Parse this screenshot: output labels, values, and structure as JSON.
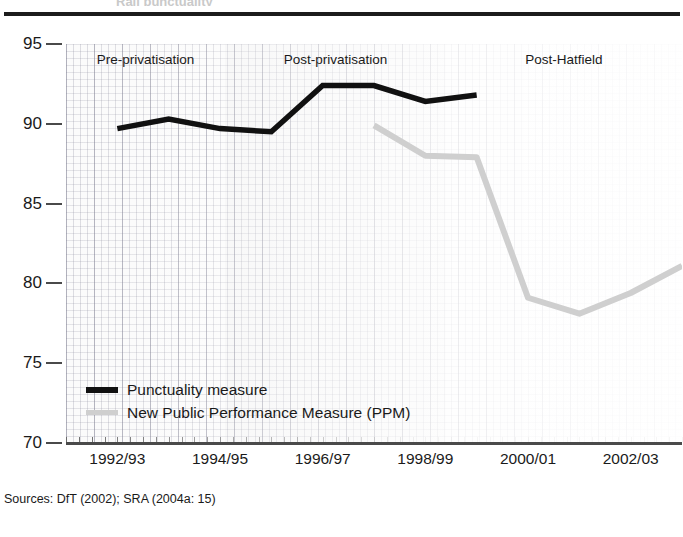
{
  "figure": {
    "clipped_title": "Rail punctuality",
    "source_note": "Sources: DfT (2002); SRA (2004a: 15)"
  },
  "chart_data": {
    "type": "line",
    "title": "",
    "xlabel": "",
    "ylabel": "",
    "ylim": [
      70,
      95
    ],
    "xlim": [
      1991.5,
      2003.5
    ],
    "grid": true,
    "legend_position": "inside-bottom-left",
    "y_ticks": [
      95,
      90,
      85,
      80,
      75,
      70
    ],
    "x_ticks": [
      "1992/93",
      "1994/95",
      "1996/97",
      "1998/99",
      "2000/01",
      "2002/03"
    ],
    "x_tick_values": [
      1992,
      1994,
      1996,
      1998,
      2000,
      2002
    ],
    "categories": [
      "1992/93",
      "1993/94",
      "1994/95",
      "1995/96",
      "1996/97",
      "1997/98",
      "1998/99",
      "1999/00",
      "2000/01",
      "2001/02",
      "2002/03",
      "2003/04"
    ],
    "series": [
      {
        "name": "Punctuality measure",
        "color": "#111111",
        "x": [
          1992,
          1993,
          1994,
          1995,
          1996,
          1997,
          1998,
          1999
        ],
        "values": [
          89.7,
          90.3,
          89.7,
          89.5,
          92.4,
          92.4,
          91.4,
          91.8
        ]
      },
      {
        "name": "New Public Performance Measure (PPM)",
        "color": "#cfcfcf",
        "x": [
          1997,
          1998,
          1999,
          2000,
          2001,
          2002,
          2003
        ],
        "values": [
          89.9,
          88.0,
          87.9,
          79.1,
          78.1,
          79.4,
          81.1
        ]
      }
    ],
    "annotations": [
      {
        "label": "Pre-privatisation",
        "x_start": 1991.5,
        "x_end": 1994.6
      },
      {
        "label": "Post-privatisation",
        "x_start": 1994.6,
        "x_end": 1998.9
      },
      {
        "label": "Post-Hatfield",
        "x_start": 1998.9,
        "x_end": 2003.5
      }
    ]
  },
  "legend": {
    "items": [
      {
        "label": "Punctuality measure"
      },
      {
        "label": "New Public Performance Measure (PPM)"
      }
    ]
  }
}
